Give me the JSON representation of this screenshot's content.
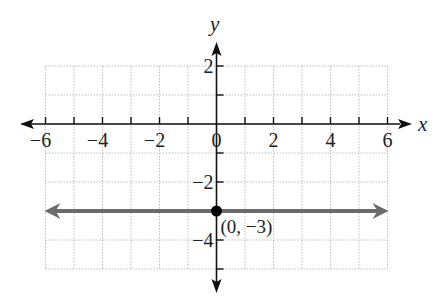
{
  "chart_data": {
    "type": "line",
    "title": "",
    "xlabel": "x",
    "ylabel": "y",
    "xlim": [
      -6,
      6
    ],
    "ylim": [
      -5,
      2
    ],
    "grid": true,
    "x_ticks": [
      -6,
      -4,
      -2,
      0,
      2,
      4,
      6
    ],
    "x_tick_labels": [
      "−6",
      "−4",
      "−2",
      "0",
      "2",
      "4",
      "6"
    ],
    "y_ticks": [
      2,
      -2,
      -4
    ],
    "y_tick_labels": [
      "2",
      "−2",
      "−4"
    ],
    "series": [
      {
        "name": "y = -3",
        "equation": "y = -3",
        "x": [
          -6,
          6
        ],
        "y": [
          -3,
          -3
        ],
        "color": "#6b6b6b",
        "arrows": "both"
      }
    ],
    "points": [
      {
        "x": 0,
        "y": -3,
        "label": "(0, −3)",
        "color": "#000000"
      }
    ]
  },
  "axes": {
    "x_name": "x",
    "y_name": "y"
  },
  "colors": {
    "axis": "#111111",
    "grid": "#bdbdbd",
    "line": "#6b6b6b",
    "point": "#000000"
  }
}
